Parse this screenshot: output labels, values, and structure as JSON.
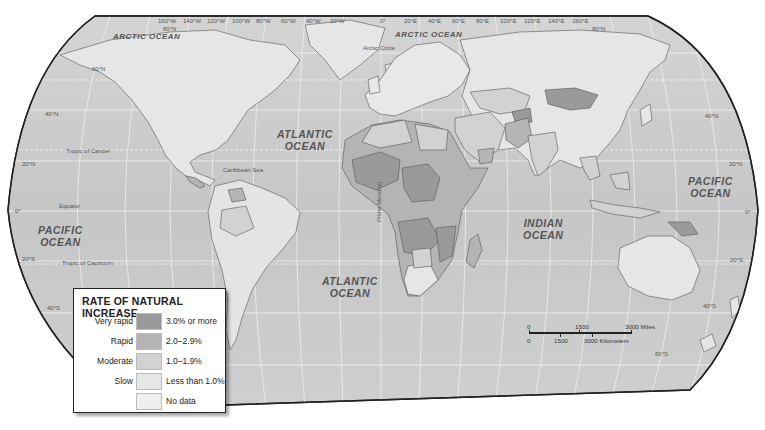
{
  "map": {
    "title": "Rate of Natural Increase world map",
    "colors": {
      "ocean": "#c9c9c9",
      "ocean_light": "#d6d6d6",
      "land_default": "#e8e8e8",
      "border": "#555555",
      "frame": "#222222",
      "graticule": "#f4f4f4"
    }
  },
  "graticule": {
    "longitudes_top": [
      "160°W",
      "140°W",
      "120°W",
      "100°W",
      "80°W",
      "60°W",
      "40°W",
      "20°W",
      "0°",
      "20°E",
      "40°E",
      "60°E",
      "80°E",
      "100°E",
      "120°E",
      "140°E",
      "160°E"
    ],
    "latitudes_left": [
      "80°N",
      "60°N",
      "40°N",
      "20°N",
      "0°",
      "20°S",
      "40°S"
    ],
    "latitudes_right": [
      "80°N",
      "40°N",
      "20°N",
      "0°",
      "20°S",
      "40°S",
      "60°S"
    ]
  },
  "reference_lines": {
    "tropic_of_cancer": "Tropic of Cancer",
    "equator": "Equator",
    "tropic_of_capricorn": "Tropic of Capricorn",
    "arctic_circle": "Arctic Circle",
    "prime_meridian": "Prime Meridian"
  },
  "place_labels": {
    "caribbean_sea": "Caribbean Sea"
  },
  "oceans": {
    "arctic_west": "ARCTIC OCEAN",
    "arctic_east": "ARCTIC OCEAN",
    "pacific_west_line1": "PACIFIC",
    "pacific_west_line2": "OCEAN",
    "pacific_east_line1": "PACIFIC",
    "pacific_east_line2": "OCEAN",
    "atlantic_north_line1": "ATLANTIC",
    "atlantic_north_line2": "OCEAN",
    "atlantic_south_line1": "ATLANTIC",
    "atlantic_south_line2": "OCEAN",
    "indian_line1": "INDIAN",
    "indian_line2": "OCEAN"
  },
  "legend": {
    "title": "RATE OF NATURAL INCREASE",
    "items": [
      {
        "category": "Very rapid",
        "range": "3.0% or more",
        "color": "#9a9a9a"
      },
      {
        "category": "Rapid",
        "range": "2.0–2.9%",
        "color": "#b4b4b4"
      },
      {
        "category": "Moderate",
        "range": "1.0–1.9%",
        "color": "#d2d2d2"
      },
      {
        "category": "Slow",
        "range": "Less than 1.0%",
        "color": "#e6e6e6"
      },
      {
        "category": "",
        "range": "No data",
        "color": "#efefef"
      }
    ]
  },
  "scale_bar": {
    "miles_zero": "0",
    "miles_mid": "1500",
    "miles_end": "3000 Miles",
    "km_zero": "0",
    "km_mid": "1500",
    "km_end": "3000 Kilometers"
  }
}
